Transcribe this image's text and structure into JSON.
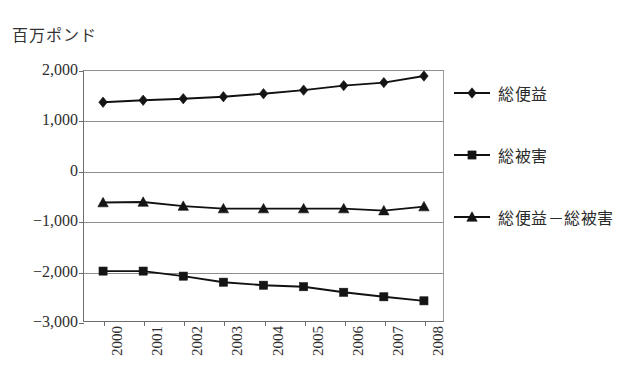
{
  "chart_data": {
    "type": "line",
    "title": "",
    "ylabel": "百万ポンド",
    "xlabel": "",
    "categories": [
      "2000",
      "2001",
      "2002",
      "2003",
      "2004",
      "2005",
      "2006",
      "2007",
      "2008"
    ],
    "ylim": [
      -3000,
      2000
    ],
    "ytick_labels": [
      "2,000",
      "1,000",
      "0",
      "−1,000",
      "−2,000",
      "−3,000"
    ],
    "ytick_values": [
      2000,
      1000,
      0,
      -1000,
      -2000,
      -3000
    ],
    "grid": true,
    "legend_position": "right",
    "series": [
      {
        "name": "総便益",
        "marker": "diamond",
        "values": [
          1360,
          1400,
          1430,
          1470,
          1530,
          1600,
          1690,
          1750,
          1880
        ]
      },
      {
        "name": "総被害",
        "marker": "square",
        "values": [
          -1990,
          -1990,
          -2090,
          -2210,
          -2270,
          -2300,
          -2410,
          -2500,
          -2580
        ]
      },
      {
        "name": "総便益－総被害",
        "marker": "triangle",
        "values": [
          -630,
          -620,
          -700,
          -750,
          -750,
          -750,
          -750,
          -790,
          -710
        ]
      }
    ]
  },
  "legend": {
    "entries": [
      {
        "label": "総便益",
        "marker": "diamond"
      },
      {
        "label": "総被害",
        "marker": "square"
      },
      {
        "label": "総便益－総被害",
        "marker": "triangle"
      }
    ]
  },
  "colors": {
    "series": "#141414",
    "gridline": "#8d8d8d",
    "axis": "#6d6d6d",
    "text": "#2a2a2a",
    "background": "#ffffff"
  }
}
